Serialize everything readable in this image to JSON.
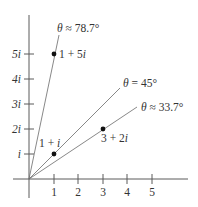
{
  "figure": {
    "x_tick_labels": [
      "1",
      "2",
      "3",
      "4",
      "5"
    ],
    "y_tick_labels": [
      "i",
      "2i",
      "3i",
      "4i",
      "5i"
    ],
    "points": [
      {
        "label": "1 + 5i",
        "re": 1,
        "im": 5
      },
      {
        "label": "1 + i",
        "re": 1,
        "im": 1
      },
      {
        "label": "3 + 2i",
        "re": 3,
        "im": 2
      }
    ],
    "angle_labels": [
      {
        "symbol": "θ",
        "relation": "≈",
        "value": "78.7°"
      },
      {
        "symbol": "θ",
        "relation": "=",
        "value": "45°"
      },
      {
        "symbol": "θ",
        "relation": "≈",
        "value": "33.7°"
      }
    ],
    "colors": {
      "axis": "#5a5a5a",
      "ray": "#6a6a6a",
      "point": "#111111",
      "text": "#333333"
    }
  }
}
